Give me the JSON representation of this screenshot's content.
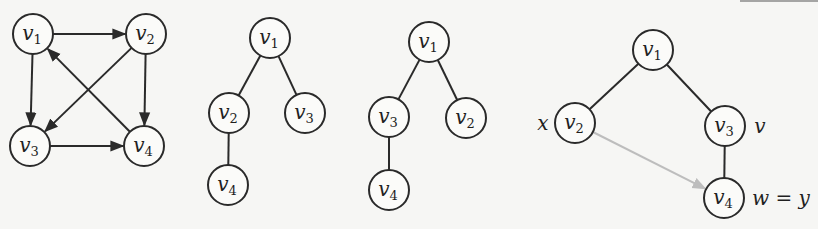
{
  "diagrams": [
    {
      "name": "directed-graph",
      "nodes": [
        {
          "id": "v1",
          "base": "v",
          "sub": "1",
          "x": 33,
          "y": 34
        },
        {
          "id": "v2",
          "base": "v",
          "sub": "2",
          "x": 146,
          "y": 34
        },
        {
          "id": "v3",
          "base": "v",
          "sub": "3",
          "x": 30,
          "y": 146
        },
        {
          "id": "v4",
          "base": "v",
          "sub": "4",
          "x": 144,
          "y": 146
        }
      ],
      "edges": [
        {
          "from": "v1",
          "to": "v2",
          "directed": true
        },
        {
          "from": "v1",
          "to": "v3",
          "directed": true
        },
        {
          "from": "v2",
          "to": "v3",
          "directed": true
        },
        {
          "from": "v2",
          "to": "v4",
          "directed": true
        },
        {
          "from": "v4",
          "to": "v1",
          "directed": true
        },
        {
          "from": "v3",
          "to": "v4",
          "directed": true
        }
      ]
    },
    {
      "name": "dfs-tree-1",
      "nodes": [
        {
          "id": "v1",
          "base": "v",
          "sub": "1",
          "x": 270,
          "y": 38
        },
        {
          "id": "v2",
          "base": "v",
          "sub": "2",
          "x": 229,
          "y": 113
        },
        {
          "id": "v3",
          "base": "v",
          "sub": "3",
          "x": 305,
          "y": 113
        },
        {
          "id": "v4",
          "base": "v",
          "sub": "4",
          "x": 228,
          "y": 185
        }
      ],
      "edges": [
        {
          "from": "v1",
          "to": "v2"
        },
        {
          "from": "v1",
          "to": "v3"
        },
        {
          "from": "v2",
          "to": "v4"
        }
      ]
    },
    {
      "name": "dfs-tree-2",
      "nodes": [
        {
          "id": "v1",
          "base": "v",
          "sub": "1",
          "x": 429,
          "y": 42
        },
        {
          "id": "v3",
          "base": "v",
          "sub": "3",
          "x": 389,
          "y": 117
        },
        {
          "id": "v2",
          "base": "v",
          "sub": "2",
          "x": 466,
          "y": 118
        },
        {
          "id": "v4",
          "base": "v",
          "sub": "4",
          "x": 389,
          "y": 190
        }
      ],
      "edges": [
        {
          "from": "v1",
          "to": "v3"
        },
        {
          "from": "v1",
          "to": "v2"
        },
        {
          "from": "v3",
          "to": "v4"
        }
      ]
    },
    {
      "name": "dfs-tree-3-annotated",
      "nodes": [
        {
          "id": "v1",
          "base": "v",
          "sub": "1",
          "x": 653,
          "y": 50
        },
        {
          "id": "v2",
          "base": "v",
          "sub": "2",
          "x": 575,
          "y": 123
        },
        {
          "id": "v3",
          "base": "v",
          "sub": "3",
          "x": 725,
          "y": 126
        },
        {
          "id": "v4",
          "base": "v",
          "sub": "4",
          "x": 724,
          "y": 198
        }
      ],
      "edges": [
        {
          "from": "v1",
          "to": "v2"
        },
        {
          "from": "v1",
          "to": "v3"
        },
        {
          "from": "v3",
          "to": "v4"
        },
        {
          "from": "v2",
          "to": "v4",
          "directed": true,
          "style": "gray"
        }
      ],
      "labels": [
        {
          "text": "x",
          "x": 543,
          "y": 130,
          "anchor": "middle"
        },
        {
          "text": "v",
          "x": 760,
          "y": 133,
          "anchor": "middle"
        },
        {
          "text": "w = y",
          "x": 752,
          "y": 205,
          "anchor": "start"
        }
      ]
    }
  ],
  "colors": {
    "stroke": "#2a2a2a",
    "gray_edge": "#bdbdbd",
    "background": "#f6f6f4"
  }
}
